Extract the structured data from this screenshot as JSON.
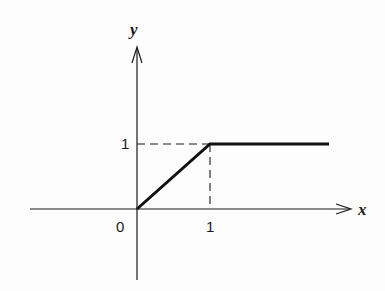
{
  "diagram": {
    "type": "function-graph",
    "axes": {
      "x_label": "x",
      "y_label": "y"
    },
    "ticks": {
      "origin_label": "0",
      "x_tick_label": "1",
      "y_tick_label": "1"
    },
    "function": {
      "description": "piecewise linear: y = x for 0 ≤ x ≤ 1, y = 1 for x > 1",
      "points": [
        [
          0,
          0
        ],
        [
          1,
          1
        ],
        [
          2.6,
          1
        ]
      ]
    },
    "guides": {
      "horizontal_dashed": "y = 1 from x = 0 to x = 1",
      "vertical_dashed": "x = 1 from y = 0 to y = 1"
    },
    "colors": {
      "ink": "#1a1a1a",
      "background": "#fdfdfd"
    }
  }
}
